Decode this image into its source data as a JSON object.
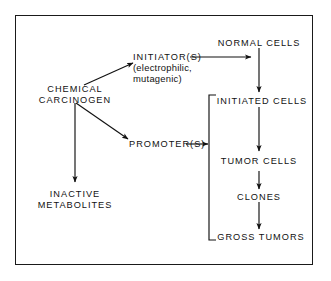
{
  "diagram": {
    "border_color": "#1a1a1a",
    "text_color": "#111111",
    "background": "#ffffff",
    "nodes": {
      "chemical_carcinogen": "CHEMICAL\nCARCINOGEN",
      "initiators": "INITIATOR(S)",
      "initiators_detail": "(electrophilic,\nmutagenic)",
      "promoters": "PROMOTER(S)",
      "inactive_metabolites": "INACTIVE\nMETABOLITES",
      "normal_cells": "NORMAL CELLS",
      "initiated_cells": "INITIATED CELLS",
      "tumor_cells": "TUMOR CELLS",
      "clones": "CLONES",
      "gross_tumors": "GROSS TUMORS"
    },
    "edges": [
      {
        "from": "chemical_carcinogen",
        "to": "initiators",
        "style": "diagonal-up-right"
      },
      {
        "from": "chemical_carcinogen",
        "to": "promoters",
        "style": "diagonal-down-right"
      },
      {
        "from": "chemical_carcinogen",
        "to": "inactive_metabolites",
        "style": "vertical-down"
      },
      {
        "from": "initiators",
        "to": "normal_cells",
        "style": "horizontal-right"
      },
      {
        "from": "normal_cells",
        "to": "initiated_cells",
        "style": "vertical-down"
      },
      {
        "from": "promoters",
        "to": "bracket",
        "style": "horizontal-right"
      },
      {
        "from": "initiated_cells",
        "to": "tumor_cells",
        "style": "vertical-down"
      },
      {
        "from": "tumor_cells",
        "to": "clones",
        "style": "vertical-down"
      },
      {
        "from": "clones",
        "to": "gross_tumors",
        "style": "vertical-down"
      }
    ],
    "bracket": {
      "label": "promotion-stage-bracket",
      "spans": [
        "initiated_cells",
        "tumor_cells",
        "clones",
        "gross_tumors"
      ]
    }
  }
}
